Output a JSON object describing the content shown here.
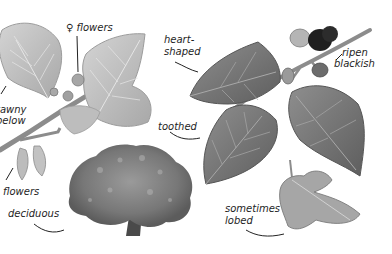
{
  "illustration": {
    "subject": "mulberry tree botanical illustration",
    "palette": {
      "background": "#ffffff",
      "leaf_light": "#c9c9c9",
      "leaf_mid": "#9a9a9a",
      "leaf_dark": "#6e6e6e",
      "vein": "#e4e4e4",
      "stem": "#8c8c8c",
      "fruit_unripe": "#b5b5b5",
      "fruit_ripe": "#1f1f1f",
      "tree_canopy": "#7d7d7d",
      "trunk": "#4a4a4a",
      "leader_line": "#222222",
      "text": "#1e1e1e"
    },
    "labels": {
      "female_flowers": "♀ flowers",
      "tawny_line1": "tawny",
      "tawny_line2": "below",
      "flowers": "flowers",
      "deciduous": "deciduous",
      "heart_line1": "heart-",
      "heart_line2": "shaped",
      "toothed": "toothed",
      "ripen_line1": "ripen",
      "ripen_line2": "blackish",
      "lobed_line1": "sometimes",
      "lobed_line2": "lobed"
    }
  }
}
